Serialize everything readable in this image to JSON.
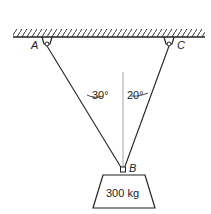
{
  "points": {
    "A": "A",
    "B": "B",
    "C": "C"
  },
  "angles": {
    "left": "30°",
    "right": "20°"
  },
  "mass": {
    "label": "300 kg"
  }
}
